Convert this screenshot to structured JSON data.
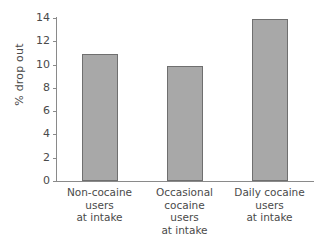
{
  "chart_data": {
    "type": "bar",
    "title": "",
    "subtitle": "",
    "xlabel": "",
    "ylabel": "% drop out",
    "ylim": [
      0,
      14
    ],
    "yticks": [
      0,
      2,
      4,
      6,
      8,
      10,
      12,
      14
    ],
    "ytick_labels": [
      "0",
      "2",
      "4",
      "6",
      "8",
      "10",
      "12",
      "14"
    ],
    "grid": false,
    "legend": null,
    "categories": [
      "Non-cocaine\nusers\nat intake",
      "Occasional\ncocaine\nusers\nat intake",
      "Daily cocaine\nusers\nat intake"
    ],
    "values": [
      10.9,
      9.9,
      13.9
    ],
    "bar_color": "#a8a8a8",
    "bar_edge_color": "#6f6f6f",
    "axis_color": "#8a8a8a",
    "text_color": "#4a4a4a",
    "background_color": "#ffffff"
  }
}
